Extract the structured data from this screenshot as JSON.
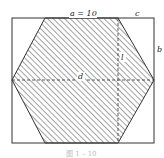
{
  "diagram": {
    "type": "geometry",
    "labels": {
      "a": "a = 10",
      "c": "c",
      "b": "b",
      "d": "d",
      "l": "l"
    },
    "caption": "图 1 – 10"
  }
}
